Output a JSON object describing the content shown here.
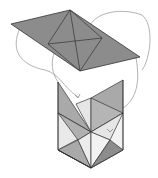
{
  "diagram": {
    "title": "",
    "colors": {
      "background": "#ffffff",
      "dark_face": "#8c8c8c",
      "mid_face": "#a9a9a9",
      "light_face": "#e6e6e6",
      "lightest_face": "#f2f2f2",
      "edge": "#333333",
      "arrow": "#9a9a9a"
    },
    "net": {
      "vertices": [
        [
          11,
          24
        ],
        [
          70,
          10
        ],
        [
          140,
          57
        ],
        [
          80,
          71
        ]
      ],
      "inner_lines": [
        [
          [
            70,
            10
          ],
          [
            80,
            71
          ]
        ],
        [
          [
            48,
            44
          ],
          [
            102,
            38
          ]
        ],
        [
          [
            48,
            44
          ],
          [
            80,
            71
          ]
        ],
        [
          [
            70,
            10
          ],
          [
            102,
            38
          ]
        ],
        [
          [
            48,
            44
          ],
          [
            102,
            38
          ]
        ]
      ]
    },
    "box": {
      "faces": 12
    },
    "arrows": 4
  }
}
